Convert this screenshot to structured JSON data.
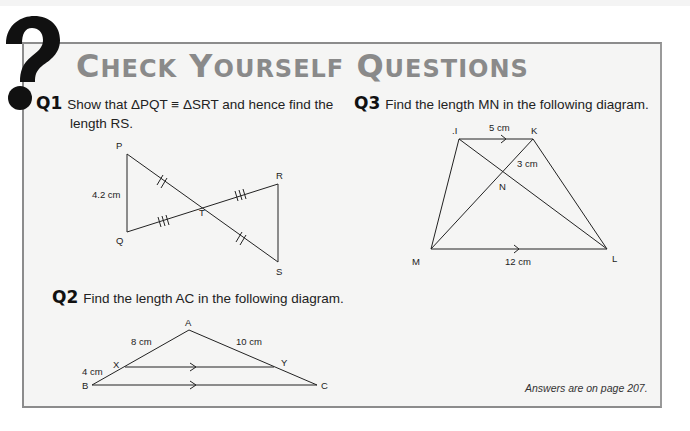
{
  "header": {
    "title_words": [
      {
        "cap": "C",
        "rest": "HECK"
      },
      {
        "cap": "Y",
        "rest": "OURSELF"
      },
      {
        "cap": "Q",
        "rest": "UESTIONS"
      }
    ],
    "icon": "question-mark-icon"
  },
  "questions": [
    {
      "number": "Q1",
      "text_line1": "Show that ΔPQT ≡ ΔSRT and hence find the",
      "text_line2": "length RS.",
      "diagram": {
        "labels": {
          "P": "P",
          "Q": "Q",
          "R": "R",
          "S": "S",
          "T": "T"
        },
        "measure_pq": "4.2 cm"
      }
    },
    {
      "number": "Q2",
      "text": "Find the length AC in the following diagram.",
      "diagram": {
        "labels": {
          "A": "A",
          "B": "B",
          "C": "C",
          "X": "X",
          "Y": "Y"
        },
        "measure_ax": "8 cm",
        "measure_ay": "10 cm",
        "measure_xb": "4 cm"
      }
    },
    {
      "number": "Q3",
      "text": "Find the length MN in the following diagram.",
      "diagram": {
        "labels": {
          "J": ".I",
          "K": "K",
          "L": "L",
          "M": "M",
          "N": "N"
        },
        "measure_jk": "5 cm",
        "measure_kn": "3 cm",
        "measure_ml": "12 cm"
      }
    }
  ],
  "footer": {
    "answers_note": "Answers are on page 207."
  },
  "colors": {
    "title_gray": "#8a8a8a",
    "panel_border": "#8c8c8c",
    "panel_bg": "#f5f5f4",
    "ink": "#222222"
  }
}
